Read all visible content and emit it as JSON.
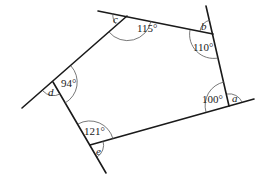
{
  "figure": {
    "interior_angles": [
      {
        "vertex": "top-left",
        "label": "115°"
      },
      {
        "vertex": "top-right",
        "label": "110°"
      },
      {
        "vertex": "bottom-right",
        "label": "100°"
      },
      {
        "vertex": "bottom-left",
        "label": "121°"
      },
      {
        "vertex": "left",
        "label": "94°"
      }
    ],
    "exterior_angles": [
      {
        "vertex": "bottom-right",
        "label": "a"
      },
      {
        "vertex": "top-right",
        "label": "b"
      },
      {
        "vertex": "top-left",
        "label": "c"
      },
      {
        "vertex": "left",
        "label": "d"
      },
      {
        "vertex": "bottom-left",
        "label": "e"
      }
    ]
  }
}
